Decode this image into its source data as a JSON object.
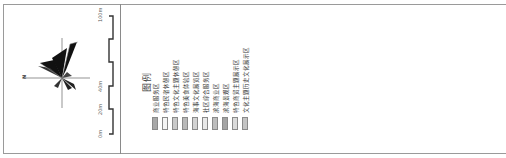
{
  "wind_rose": {
    "north_label": "N"
  },
  "scale_bar": {
    "ticks": [
      "0m",
      "20m",
      "40m",
      "100m"
    ]
  },
  "legend": {
    "title": "图例",
    "items": [
      {
        "label": "商业服务区",
        "color": "#a8a8a8"
      },
      {
        "label": "特色民宿休憩区",
        "color": "#f4f4f4"
      },
      {
        "label": "特色文化主题休憩区",
        "color": "#c9c9c9"
      },
      {
        "label": "特色美食体验区",
        "color": "#b9b9b9"
      },
      {
        "label": "海事文化展览区",
        "color": "#d2d2d2"
      },
      {
        "label": "社区综合服务区",
        "color": "#e8e8e8"
      },
      {
        "label": "滨海商业区",
        "color": "#bdbdbd"
      },
      {
        "label": "滨海景观区",
        "color": "#a4a4a4"
      },
      {
        "label": "特色商贸主题展示区",
        "color": "#dadada"
      },
      {
        "label": "文化主题历史文化展示区",
        "color": "#c4c4c4"
      }
    ]
  }
}
